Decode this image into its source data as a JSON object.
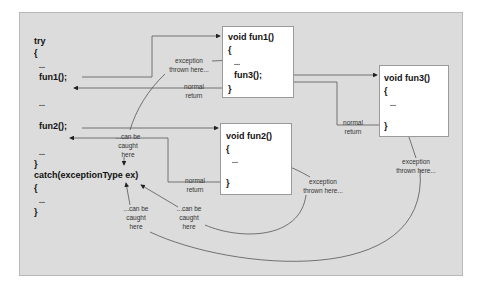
{
  "diagram": {
    "colors": {
      "panel": "#dcdcdc",
      "box": "#ffffff",
      "line": "#444444",
      "text": "#111111"
    },
    "main_code": {
      "try": "try",
      "open1": "{",
      "dots1": "...",
      "call_fun1": "fun1();",
      "dots2": "...",
      "call_fun2": "fun2();",
      "dots3": "...",
      "close1": "}",
      "catch": "catch(exceptionType ex)",
      "open2": "{",
      "dots4": "...",
      "close2": "}"
    },
    "fun1_box": {
      "signature": "void fun1()",
      "open": "{",
      "dots": "...",
      "call": "fun3();",
      "close": "}"
    },
    "fun2_box": {
      "signature": "void fun2()",
      "open": "{",
      "dots": "...",
      "close": "}"
    },
    "fun3_box": {
      "signature": "void fun3()",
      "open": "{",
      "dots": "...",
      "close": "}"
    },
    "labels": {
      "exception_fun1": "exception\nthrown here...",
      "normal_return_fun1": "normal\nreturn",
      "can_be_caught_top": "...can be\ncaught\nhere",
      "normal_return_fun2": "normal\nreturn",
      "normal_return_fun3": "normal\nreturn",
      "exception_fun2": "exception\nthrown here...",
      "exception_fun3": "exception\nthrown here...",
      "can_be_caught_left": "...can be\ncaught\nhere",
      "can_be_caught_mid": "...can be\ncaught\nhere"
    }
  }
}
